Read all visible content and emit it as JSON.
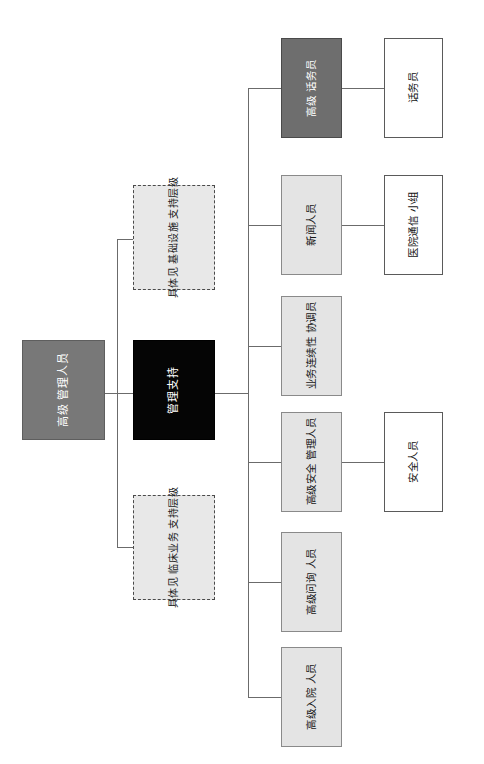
{
  "diagram": {
    "orientation": "rotated-90",
    "colors": {
      "root_fill": "#787878",
      "support_fill": "#050505",
      "dashed_fill": "#e8e8e8",
      "highlight_fill": "#6e6e6e",
      "node_fill": "#e4e4e4",
      "leaf_fill": "#ffffff",
      "connector": "#6b6b6b"
    },
    "root": {
      "lines": [
        "高级",
        "管理人员"
      ]
    },
    "support": {
      "lines": [
        "管理支持"
      ]
    },
    "references": [
      {
        "lines": [
          "具体见",
          "基础设施",
          "支持层级"
        ]
      },
      {
        "lines": [
          "具体见",
          "临床业务",
          "支持层级"
        ]
      }
    ],
    "branches": [
      {
        "style": "highlight",
        "lines": [
          "高级",
          "话务员"
        ],
        "child": {
          "style": "leaf",
          "lines": [
            "话务员"
          ]
        }
      },
      {
        "style": "node",
        "lines": [
          "新闻人员"
        ],
        "child": {
          "style": "leaf",
          "lines": [
            "医院通信",
            "小组"
          ]
        }
      },
      {
        "style": "node",
        "lines": [
          "业务连续性",
          "协调员"
        ],
        "child": null
      },
      {
        "style": "node",
        "lines": [
          "高级安全",
          "管理人员"
        ],
        "child": {
          "style": "leaf",
          "lines": [
            "安全人员"
          ]
        }
      },
      {
        "style": "node",
        "lines": [
          "高级问询",
          "人员"
        ],
        "child": null
      },
      {
        "style": "node",
        "lines": [
          "高级入院",
          "人员"
        ],
        "child": null
      }
    ]
  }
}
